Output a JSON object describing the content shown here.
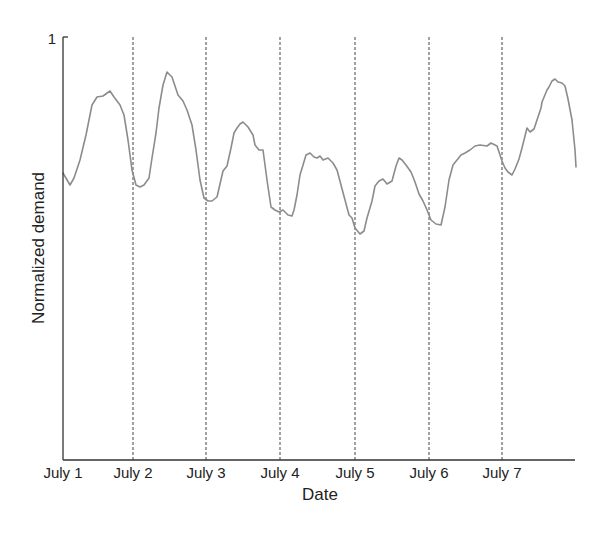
{
  "chart_data": {
    "type": "line",
    "title": "",
    "xlabel": "Date",
    "ylabel": "Normalized demand",
    "ylim": [
      0,
      1
    ],
    "ytick_labels": [
      "1"
    ],
    "xtick_labels": [
      "July 1",
      "July 2",
      "July 3",
      "July 4",
      "July 5",
      "July 6",
      "July 7"
    ],
    "grid": "vertical dashed lines at each day boundary (July 2 – July 7)",
    "legend": null,
    "series": [
      {
        "name": "Normalized demand",
        "color": "#8c8c8c",
        "x_days": [
          0.0,
          0.09,
          0.15,
          0.23,
          0.31,
          0.39,
          0.46,
          0.54,
          0.63,
          0.69,
          0.77,
          0.82,
          0.88,
          0.93,
          0.99,
          1.04,
          1.1,
          1.16,
          1.2,
          1.26,
          1.3,
          1.35,
          1.4,
          1.45,
          1.48,
          1.5,
          1.56,
          1.62,
          1.68,
          1.74,
          1.8,
          1.85,
          1.91,
          1.96,
          2.02,
          2.09,
          2.17,
          2.22,
          2.27,
          2.31,
          2.35,
          2.4,
          2.44,
          2.51,
          2.58,
          2.6,
          2.65,
          2.71,
          2.76,
          2.82,
          2.87,
          2.93,
          2.98,
          3.04,
          3.1,
          3.13,
          3.17,
          3.21,
          3.25,
          3.29,
          3.34,
          3.39,
          3.44,
          3.48,
          3.52,
          3.59,
          3.65,
          3.7,
          3.76,
          3.81,
          3.87,
          3.91,
          3.96,
          4.02,
          4.07,
          4.12,
          4.18,
          4.22,
          4.28,
          4.33,
          4.39,
          4.45,
          4.5,
          4.55,
          4.59,
          4.65,
          4.72,
          4.76,
          4.82,
          4.88,
          4.94,
          4.99,
          5.05,
          5.12,
          5.17,
          5.22,
          5.28,
          5.33,
          5.39,
          5.44,
          5.49,
          5.56,
          5.63,
          5.7,
          5.79,
          5.84,
          5.91,
          5.95,
          6.0,
          6.06,
          6.11,
          6.16,
          6.21,
          6.27,
          6.31,
          6.37,
          6.42,
          6.45,
          6.5,
          6.54,
          6.58,
          6.62,
          6.67,
          6.72,
          6.76,
          6.81,
          6.86,
          6.92,
          6.97,
          7.02,
          7.07,
          7.1
        ],
        "values": [
          0.678,
          0.65,
          0.667,
          0.709,
          0.768,
          0.839,
          0.858,
          0.861,
          0.872,
          0.858,
          0.839,
          0.816,
          0.756,
          0.686,
          0.65,
          0.645,
          0.65,
          0.667,
          0.714,
          0.773,
          0.832,
          0.887,
          0.917,
          0.91,
          0.905,
          0.891,
          0.863,
          0.849,
          0.827,
          0.792,
          0.733,
          0.662,
          0.619,
          0.612,
          0.612,
          0.622,
          0.683,
          0.695,
          0.738,
          0.773,
          0.785,
          0.794,
          0.799,
          0.787,
          0.768,
          0.745,
          0.733,
          0.733,
          0.662,
          0.598,
          0.591,
          0.586,
          0.591,
          0.579,
          0.577,
          0.591,
          0.626,
          0.674,
          0.697,
          0.721,
          0.726,
          0.716,
          0.714,
          0.719,
          0.709,
          0.714,
          0.702,
          0.686,
          0.65,
          0.615,
          0.579,
          0.572,
          0.548,
          0.534,
          0.541,
          0.572,
          0.612,
          0.648,
          0.66,
          0.664,
          0.652,
          0.66,
          0.695,
          0.714,
          0.707,
          0.69,
          0.66,
          0.636,
          0.612,
          0.582,
          0.56,
          0.544,
          0.52,
          0.511,
          0.508,
          0.556,
          0.615,
          0.657,
          0.674,
          0.686,
          0.69,
          0.697,
          0.707,
          0.709,
          0.707,
          0.714,
          0.707,
          0.674,
          0.65,
          0.655,
          0.65,
          0.669,
          0.693,
          0.719,
          0.764,
          0.775,
          0.783,
          0.83,
          0.846,
          0.876,
          0.882,
          0.896,
          0.901,
          0.894,
          0.891,
          0.884,
          0.853,
          0.806,
          0.733,
          0.693
        ],
        "pixel_path": [
          [
            63,
            173
          ],
          [
            70,
            185
          ],
          [
            74,
            178
          ],
          [
            80,
            160
          ],
          [
            86,
            135
          ],
          [
            92,
            105
          ],
          [
            97,
            97
          ],
          [
            103,
            96
          ],
          [
            110,
            91
          ],
          [
            114,
            97
          ],
          [
            120,
            105
          ],
          [
            124,
            115
          ],
          [
            128,
            140
          ],
          [
            132,
            170
          ],
          [
            136,
            185
          ],
          [
            140,
            187
          ],
          [
            144,
            185
          ],
          [
            149,
            178
          ],
          [
            152,
            158
          ],
          [
            156,
            133
          ],
          [
            159,
            108
          ],
          [
            163,
            85
          ],
          [
            167,
            72
          ],
          [
            170,
            75
          ],
          [
            172,
            77
          ],
          [
            174,
            83
          ],
          [
            178,
            95
          ],
          [
            183,
            101
          ],
          [
            187,
            110
          ],
          [
            192,
            125
          ],
          [
            196,
            150
          ],
          [
            200,
            180
          ],
          [
            204,
            198
          ],
          [
            208,
            201
          ],
          [
            212,
            201
          ],
          [
            217,
            197
          ],
          [
            223,
            171
          ],
          [
            227,
            166
          ],
          [
            231,
            148
          ],
          [
            234,
            133
          ],
          [
            237,
            128
          ],
          [
            240,
            124
          ],
          [
            243,
            122
          ],
          [
            248,
            127
          ],
          [
            253,
            135
          ],
          [
            255,
            145
          ],
          [
            259,
            150
          ],
          [
            263,
            150
          ],
          [
            267,
            180
          ],
          [
            271,
            207
          ],
          [
            275,
            210
          ],
          [
            279,
            212
          ],
          [
            283,
            210
          ],
          [
            288,
            215
          ],
          [
            292,
            216
          ],
          [
            294,
            210
          ],
          [
            297,
            195
          ],
          [
            300,
            175
          ],
          [
            303,
            165
          ],
          [
            306,
            155
          ],
          [
            310,
            153
          ],
          [
            314,
            157
          ],
          [
            317,
            158
          ],
          [
            320,
            156
          ],
          [
            323,
            160
          ],
          [
            328,
            158
          ],
          [
            333,
            163
          ],
          [
            337,
            170
          ],
          [
            341,
            185
          ],
          [
            345,
            200
          ],
          [
            349,
            215
          ],
          [
            352,
            218
          ],
          [
            355,
            228
          ],
          [
            360,
            234
          ],
          [
            364,
            231
          ],
          [
            367,
            218
          ],
          [
            372,
            201
          ],
          [
            375,
            186
          ],
          [
            379,
            181
          ],
          [
            383,
            179
          ],
          [
            387,
            184
          ],
          [
            392,
            181
          ],
          [
            396,
            166
          ],
          [
            399,
            158
          ],
          [
            402,
            160
          ],
          [
            406,
            165
          ],
          [
            411,
            172
          ],
          [
            415,
            182
          ],
          [
            419,
            194
          ],
          [
            423,
            201
          ],
          [
            427,
            210
          ],
          [
            431,
            220
          ],
          [
            436,
            224
          ],
          [
            441,
            225
          ],
          [
            445,
            207
          ],
          [
            449,
            180
          ],
          [
            453,
            165
          ],
          [
            457,
            160
          ],
          [
            461,
            155
          ],
          [
            465,
            153
          ],
          [
            470,
            150
          ],
          [
            475,
            146
          ],
          [
            480,
            145
          ],
          [
            487,
            146
          ],
          [
            491,
            143
          ],
          [
            497,
            146
          ],
          [
            502,
            161
          ],
          [
            505,
            168
          ],
          [
            508,
            172
          ],
          [
            512,
            175
          ],
          [
            515,
            169
          ],
          [
            519,
            159
          ],
          [
            522,
            148
          ],
          [
            527,
            128
          ],
          [
            530,
            132
          ],
          [
            534,
            129
          ],
          [
            541,
            108
          ],
          [
            542,
            102
          ],
          [
            547,
            90
          ],
          [
            549,
            87
          ],
          [
            552,
            81
          ],
          [
            555,
            79
          ],
          [
            558,
            82
          ],
          [
            562,
            83
          ],
          [
            565,
            86
          ],
          [
            568,
            99
          ],
          [
            572,
            120
          ],
          [
            575,
            150
          ],
          [
            576,
            167
          ]
        ]
      }
    ],
    "layout": {
      "plot_left_px": 63,
      "plot_top_px": 37,
      "plot_bottom_px": 460,
      "plot_right_px": 575,
      "day_px": [
        63,
        133,
        206,
        280,
        355,
        429,
        502
      ]
    }
  }
}
